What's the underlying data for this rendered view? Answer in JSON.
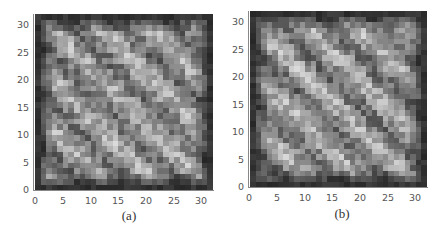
{
  "chart_data": [
    {
      "type": "heatmap",
      "title": "",
      "caption": "(a)",
      "xlabel": "",
      "ylabel": "",
      "xlim": [
        0,
        32
      ],
      "ylim": [
        0,
        32
      ],
      "x_ticks": [
        "0",
        "5",
        "10",
        "15",
        "20",
        "25",
        "30"
      ],
      "y_ticks": [
        "0",
        "5",
        "10",
        "15",
        "20",
        "25",
        "30"
      ],
      "grid_size": [
        32,
        32
      ],
      "colormap": "grayscale",
      "description": "32x32 grayscale intensity grid with dark border and diagonal bright bands running from top-left to bottom-right",
      "pattern": {
        "band_period": 9,
        "band_phase": 0.0,
        "border_dark": 0.15,
        "seed": 17
      },
      "legend": "none"
    },
    {
      "type": "heatmap",
      "title": "",
      "caption": "(b)",
      "xlabel": "",
      "ylabel": "",
      "xlim": [
        0,
        32
      ],
      "ylim": [
        0,
        32
      ],
      "x_ticks": [
        "0",
        "5",
        "10",
        "15",
        "20",
        "25",
        "30"
      ],
      "y_ticks": [
        "0",
        "5",
        "10",
        "15",
        "20",
        "25",
        "30"
      ],
      "grid_size": [
        32,
        32
      ],
      "colormap": "grayscale",
      "description": "32x32 grayscale intensity grid with dark border and diagonal bright bands running from top-left to bottom-right (slightly different noise)",
      "pattern": {
        "band_period": 9,
        "band_phase": 1.2,
        "border_dark": 0.15,
        "seed": 53
      },
      "legend": "none"
    }
  ],
  "panels": [
    {
      "caption": "(a)",
      "ticks": [
        "0",
        "5",
        "10",
        "15",
        "20",
        "25",
        "30"
      ]
    },
    {
      "caption": "(b)",
      "ticks": [
        "0",
        "5",
        "10",
        "15",
        "20",
        "25",
        "30"
      ]
    }
  ]
}
